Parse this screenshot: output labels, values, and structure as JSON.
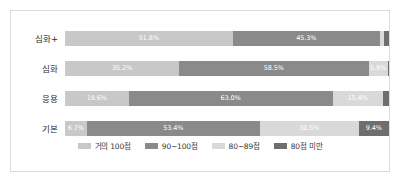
{
  "chart_data": {
    "type": "bar",
    "subtype": "horizontal-100-percent-stacked",
    "title": "",
    "xlabel": "",
    "ylabel": "",
    "xlim": [
      0,
      100
    ],
    "grid": false,
    "legend_position": "bottom",
    "categories": [
      "심화+",
      "심화",
      "응용",
      "기본"
    ],
    "series": [
      {
        "name": "거의 100점",
        "color": "#c8c8c8",
        "values": [
          51.8,
          35.2,
          19.6,
          6.7
        ],
        "labels": [
          "51.8%",
          "35.2%",
          "19.6%",
          "6.7%"
        ]
      },
      {
        "name": "90~100점",
        "color": "#8a8a8a",
        "values": [
          45.3,
          58.5,
          63.0,
          53.4
        ],
        "labels": [
          "45.3%",
          "58.5%",
          "63.0%",
          "53.4%"
        ]
      },
      {
        "name": "80~89점",
        "color": "#d9d9d9",
        "values": [
          1.4,
          5.9,
          15.4,
          30.5
        ],
        "labels": [
          "",
          "5.9%",
          "15.4%",
          "30.5%"
        ]
      },
      {
        "name": "80점 미만",
        "color": "#6e6e6e",
        "values": [
          1.5,
          0.4,
          2.0,
          9.4
        ],
        "labels": [
          "",
          "",
          "",
          "9.4%"
        ]
      }
    ]
  },
  "legend": {
    "items": [
      {
        "label": "거의 100점",
        "color": "#c8c8c8"
      },
      {
        "label": "90~100점",
        "color": "#8a8a8a"
      },
      {
        "label": "80~89점",
        "color": "#d9d9d9"
      },
      {
        "label": "80점 미만",
        "color": "#6e6e6e"
      }
    ]
  },
  "style": {
    "frame_border_color": "#dcdcdc",
    "background": "#ffffff",
    "category_label_color": "#2b2b2b",
    "segment_label_color": "#ffffff"
  }
}
